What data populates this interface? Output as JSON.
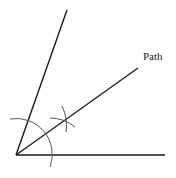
{
  "diagram": {
    "labels": {
      "bisector": "Path"
    },
    "colors": {
      "line": "#1a1a1a",
      "arc": "#555555",
      "text": "#222222"
    },
    "vertex": [
      16,
      155
    ],
    "rays": [
      {
        "name": "base-ray",
        "to": [
          165,
          155
        ]
      },
      {
        "name": "upper-ray",
        "to": [
          67,
          10
        ]
      },
      {
        "name": "bisector-ray",
        "to": [
          138,
          68
        ]
      }
    ],
    "arcs": [
      {
        "name": "compass-arc-vertex",
        "center": [
          16,
          155
        ],
        "radius": 36
      },
      {
        "name": "compass-arc-intersection",
        "point": [
          64,
          120
        ]
      }
    ]
  }
}
